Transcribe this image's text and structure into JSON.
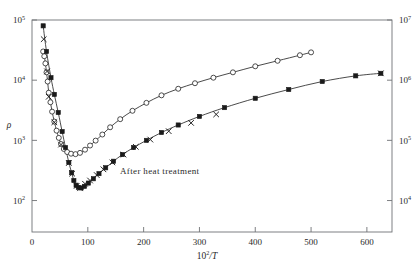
{
  "chart_data": {
    "type": "scatter",
    "title": "",
    "xlabel": "10²/T",
    "xlabel_mantissa": "10",
    "xlabel_exponent": "2",
    "xlabel_denominator": "/T",
    "ylabel": "ρ",
    "ylabel_right": "",
    "xlim": [
      0,
      645
    ],
    "xticks": [
      0,
      100,
      200,
      300,
      400,
      500,
      600
    ],
    "xticklabels": [
      "0",
      "100",
      "200",
      "300",
      "400",
      "500",
      "600"
    ],
    "yscale": "log",
    "ylim_left": [
      30,
      100000
    ],
    "yticks_left": [
      100,
      1000,
      10000,
      100000
    ],
    "yticklabels_left": [
      "10²",
      "10³",
      "10⁴",
      "10⁵"
    ],
    "yticklabels_left_mantissa": "10",
    "yticklabels_left_exponents": [
      "2",
      "3",
      "4",
      "5"
    ],
    "ylim_right": [
      3000,
      10000000
    ],
    "yticks_right": [
      10000,
      100000,
      1000000,
      10000000
    ],
    "yticklabels_right": [
      "10⁴",
      "10⁵",
      "10⁶",
      "10⁷"
    ],
    "yticklabels_right_exponents": [
      "4",
      "5",
      "6",
      "7"
    ],
    "grid": false,
    "legend_position": "none",
    "annotations": [
      {
        "text": "After heat treatment",
        "x": 148,
        "y": 175,
        "pixel_x": 120,
        "pixel_y": 174
      }
    ],
    "series": [
      {
        "name": "as-received (open circles)",
        "marker": "open-circle",
        "axis": "left",
        "color": "#1a1a1a",
        "points": [
          [
            20,
            30000
          ],
          [
            22,
            25000
          ],
          [
            24,
            19000
          ],
          [
            26,
            13500
          ],
          [
            28,
            9500
          ],
          [
            30,
            6200
          ],
          [
            33,
            4300
          ],
          [
            36,
            3000
          ],
          [
            40,
            2050
          ],
          [
            44,
            1450
          ],
          [
            48,
            1100
          ],
          [
            52,
            870
          ],
          [
            57,
            720
          ],
          [
            63,
            640
          ],
          [
            70,
            600
          ],
          [
            78,
            590
          ],
          [
            86,
            620
          ],
          [
            95,
            700
          ],
          [
            104,
            820
          ],
          [
            114,
            990
          ],
          [
            126,
            1250
          ],
          [
            140,
            1650
          ],
          [
            158,
            2250
          ],
          [
            180,
            3100
          ],
          [
            205,
            4200
          ],
          [
            232,
            5600
          ],
          [
            262,
            7200
          ],
          [
            292,
            8900
          ],
          [
            325,
            11000
          ],
          [
            360,
            13500
          ],
          [
            400,
            17000
          ],
          [
            440,
            21000
          ],
          [
            480,
            26000
          ],
          [
            500,
            29000
          ]
        ]
      },
      {
        "name": "after heat treatment (filled)",
        "marker": "filled-square",
        "axis": "left",
        "color": "#1a1a1a",
        "points": [
          [
            20,
            80000
          ],
          [
            26,
            30000
          ],
          [
            34,
            11000
          ],
          [
            40,
            5800
          ],
          [
            47,
            2900
          ],
          [
            54,
            1400
          ],
          [
            60,
            760
          ],
          [
            66,
            430
          ],
          [
            71,
            290
          ],
          [
            75,
            215
          ],
          [
            79,
            180
          ],
          [
            83,
            165
          ],
          [
            88,
            162
          ],
          [
            94,
            172
          ],
          [
            101,
            195
          ],
          [
            110,
            230
          ],
          [
            120,
            280
          ],
          [
            132,
            350
          ],
          [
            146,
            450
          ],
          [
            162,
            580
          ],
          [
            182,
            760
          ],
          [
            205,
            1000
          ],
          [
            232,
            1350
          ],
          [
            262,
            1800
          ],
          [
            300,
            2500
          ],
          [
            345,
            3500
          ],
          [
            400,
            5000
          ],
          [
            460,
            7000
          ],
          [
            520,
            9500
          ],
          [
            580,
            11800
          ],
          [
            625,
            13000
          ]
        ]
      },
      {
        "name": "cross markers (overlay)",
        "marker": "x",
        "axis": "left",
        "color": "#1a1a1a",
        "points": [
          [
            21,
            48000
          ],
          [
            27,
            14000
          ],
          [
            30,
            5300
          ],
          [
            40,
            2000
          ],
          [
            52,
            850
          ],
          [
            66,
            420
          ],
          [
            72,
            280
          ],
          [
            80,
            175
          ],
          [
            86,
            160
          ],
          [
            95,
            190
          ],
          [
            104,
            215
          ],
          [
            116,
            265
          ],
          [
            128,
            330
          ],
          [
            144,
            430
          ],
          [
            164,
            580
          ],
          [
            186,
            780
          ],
          [
            212,
            1030
          ],
          [
            245,
            1420
          ],
          [
            285,
            1950
          ],
          [
            330,
            2700
          ],
          [
            625,
            13000
          ]
        ]
      }
    ]
  }
}
